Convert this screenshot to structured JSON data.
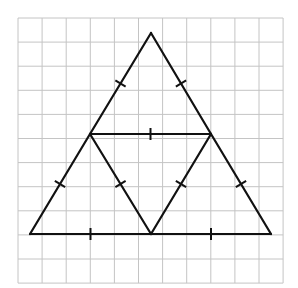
{
  "diagram": {
    "type": "geometry",
    "grid": {
      "x0": 18,
      "y0": 18,
      "cell": 24.1,
      "cols": 11,
      "rows": 11,
      "color": "#c4c4c4"
    },
    "line_color": "#111111",
    "vertices": {
      "apex": [
        151,
        33
      ],
      "mid_left": [
        90,
        134
      ],
      "mid_right": [
        211,
        134
      ],
      "base_left": [
        30,
        234
      ],
      "base_mid": [
        151,
        234
      ],
      "base_right": [
        271,
        234
      ]
    },
    "segments": [
      {
        "name": "apex-to-mid-left",
        "from": "apex",
        "to": "mid_left"
      },
      {
        "name": "apex-to-mid-right",
        "from": "apex",
        "to": "mid_right"
      },
      {
        "name": "mid-left-to-base-left",
        "from": "mid_left",
        "to": "base_left"
      },
      {
        "name": "mid-right-to-base-right",
        "from": "mid_right",
        "to": "base_right"
      },
      {
        "name": "midline",
        "from": "mid_left",
        "to": "mid_right"
      },
      {
        "name": "base-left-half",
        "from": "base_left",
        "to": "base_mid"
      },
      {
        "name": "base-right-half",
        "from": "base_mid",
        "to": "base_right"
      },
      {
        "name": "inner-left",
        "from": "mid_left",
        "to": "base_mid"
      },
      {
        "name": "inner-right",
        "from": "mid_right",
        "to": "base_mid"
      }
    ],
    "tick_marks": {
      "count_per_segment": 1,
      "meaning": "all nine segments are equal length"
    }
  }
}
